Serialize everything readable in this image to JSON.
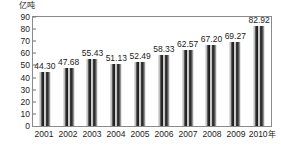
{
  "chart_data": {
    "type": "bar",
    "title": "",
    "subtitle": "",
    "xlabel": "年",
    "ylabel": "亿吨",
    "categories": [
      "2001",
      "2002",
      "2003",
      "2004",
      "2005",
      "2006",
      "2007",
      "2008",
      "2009",
      "2010"
    ],
    "values": [
      44.3,
      47.68,
      55.43,
      51.13,
      52.49,
      58.33,
      62.57,
      67.2,
      69.27,
      82.92
    ],
    "value_labels": [
      "44.30",
      "47.68",
      "55.43",
      "51.13",
      "52.49",
      "58.33",
      "62.57",
      "67.20",
      "69.27",
      "82.92"
    ],
    "ylim": [
      0,
      90
    ],
    "ytick_step": 10,
    "ytick_labels": [
      "0",
      "10",
      "20",
      "30",
      "40",
      "50",
      "60",
      "70",
      "80",
      "90"
    ],
    "xtick_labels": [
      "2001",
      "2002",
      "2003",
      "2004",
      "2005",
      "2006",
      "2007",
      "2008",
      "2009",
      "2010"
    ],
    "x_axis_unit_suffix": "年",
    "grid": false,
    "legend": false,
    "legend_position": "none",
    "series": [
      {
        "name": "",
        "values": [
          44.3,
          47.68,
          55.43,
          51.13,
          52.49,
          58.33,
          62.57,
          67.2,
          69.27,
          82.92
        ]
      }
    ],
    "colors": {
      "bar_dark": "#1d1d1d",
      "bar_mid": "#6a6a6a",
      "bar_light": "#fbfbfb",
      "axis": "#8a8a8a",
      "text": "#1b1b1b",
      "background": "#ffffff"
    }
  }
}
